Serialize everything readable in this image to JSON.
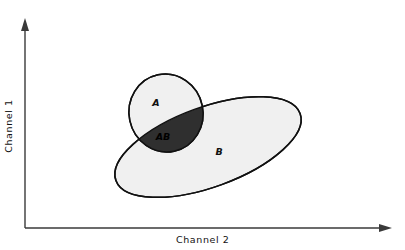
{
  "figure": {
    "background_color": "#ffffff",
    "axis_color": "#3a3a3a",
    "outline_color": "#111111",
    "fill_light": "#f0f0f0",
    "fill_dark": "#2f2f2f",
    "label_color_light_region": "#111111",
    "label_color_dark_region": "#000000"
  },
  "axes": {
    "y_label": "Channel 1",
    "x_label": "Channel 2",
    "y_arrow": "arrow-up",
    "x_arrow": "arrow-right",
    "origin_x": 25,
    "origin_y": 228,
    "y_top": 18,
    "x_right": 392
  },
  "chart_data": {
    "type": "diagram",
    "title": "",
    "xlabel": "Channel 2",
    "ylabel": "Channel 1",
    "grid": false,
    "legend": "none",
    "axis_ticks": [],
    "regions": [
      {
        "id": "A",
        "label": "A",
        "shape": "ellipse",
        "fill": "#f0f0f0",
        "stroke": "#111111",
        "center_x": 166,
        "center_y": 113,
        "radius_x": 37,
        "radius_y": 39,
        "rotation_deg": -12,
        "label_x": 156,
        "label_y": 106
      },
      {
        "id": "B",
        "label": "B",
        "shape": "ellipse",
        "fill": "#f0f0f0",
        "stroke": "#111111",
        "center_x": 208,
        "center_y": 147,
        "radius_x": 98,
        "radius_y": 40,
        "rotation_deg": -20,
        "label_x": 219,
        "label_y": 155
      },
      {
        "id": "AB",
        "label": "AB",
        "shape": "intersection",
        "of": [
          "A",
          "B"
        ],
        "fill": "#2f2f2f",
        "stroke": "#111111",
        "label_x": 163,
        "label_y": 140
      }
    ]
  }
}
